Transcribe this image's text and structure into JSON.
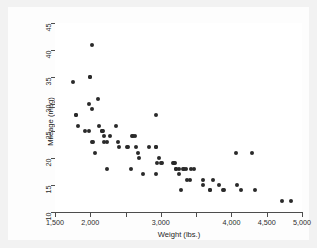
{
  "figure": {
    "background_color": "#f2f2f2",
    "plot_background_color": "#ffffff",
    "marker_color": "#2a2a2a",
    "axis_color": "#4d4d4d"
  },
  "chart_data": {
    "type": "scatter",
    "title": "",
    "xlabel": "Weight (lbs.)",
    "ylabel": "Mileage (mpg)",
    "xlim": [
      1500,
      5000
    ],
    "ylim": [
      10,
      45
    ],
    "grid": false,
    "legend": "none",
    "xticks": [
      1500,
      2000,
      2500,
      3000,
      3500,
      4000,
      4500,
      5000
    ],
    "xticklabels": [
      "1,500",
      "2,000",
      "",
      "3,000",
      "",
      "4,000",
      "4,500",
      "5,000"
    ],
    "yticks": [
      10,
      15,
      20,
      25,
      30,
      35,
      40,
      45
    ],
    "yticklabels": [
      "10",
      "15",
      "20",
      "25",
      "30",
      "35",
      "40",
      "45"
    ],
    "series": [
      {
        "name": "Mileage vs Weight",
        "marker": "circle",
        "color": "#2a2a2a",
        "points": [
          [
            1760,
            34
          ],
          [
            1800,
            28
          ],
          [
            1800,
            28
          ],
          [
            1830,
            26
          ],
          [
            1930,
            25
          ],
          [
            1980,
            25
          ],
          [
            1980,
            30
          ],
          [
            2000,
            35
          ],
          [
            2000,
            35
          ],
          [
            2020,
            41
          ],
          [
            2020,
            29
          ],
          [
            2020,
            23
          ],
          [
            2040,
            23
          ],
          [
            2070,
            21
          ],
          [
            2110,
            31
          ],
          [
            2120,
            26
          ],
          [
            2160,
            25
          ],
          [
            2160,
            25
          ],
          [
            2180,
            25
          ],
          [
            2190,
            24
          ],
          [
            2200,
            23
          ],
          [
            2230,
            23
          ],
          [
            2240,
            18
          ],
          [
            2280,
            24
          ],
          [
            2370,
            26
          ],
          [
            2390,
            23
          ],
          [
            2410,
            22
          ],
          [
            2520,
            22
          ],
          [
            2530,
            22
          ],
          [
            2580,
            18
          ],
          [
            2590,
            24
          ],
          [
            2600,
            24
          ],
          [
            2640,
            24
          ],
          [
            2650,
            22
          ],
          [
            2670,
            21
          ],
          [
            2690,
            20
          ],
          [
            2750,
            17
          ],
          [
            2830,
            22
          ],
          [
            2930,
            28
          ],
          [
            2930,
            22
          ],
          [
            2930,
            22
          ],
          [
            2930,
            17
          ],
          [
            2950,
            19
          ],
          [
            2980,
            20
          ],
          [
            3000,
            19
          ],
          [
            3020,
            19
          ],
          [
            3170,
            19
          ],
          [
            3180,
            19
          ],
          [
            3200,
            19
          ],
          [
            3210,
            18
          ],
          [
            3220,
            18
          ],
          [
            3250,
            18
          ],
          [
            3260,
            17
          ],
          [
            3280,
            14
          ],
          [
            3310,
            18
          ],
          [
            3330,
            18
          ],
          [
            3350,
            18
          ],
          [
            3370,
            16
          ],
          [
            3420,
            16
          ],
          [
            3430,
            18
          ],
          [
            3470,
            18
          ],
          [
            3600,
            16
          ],
          [
            3600,
            15
          ],
          [
            3690,
            14
          ],
          [
            3700,
            14
          ],
          [
            3740,
            16
          ],
          [
            3830,
            15
          ],
          [
            3880,
            14
          ],
          [
            3900,
            14
          ],
          [
            4060,
            21
          ],
          [
            4080,
            15
          ],
          [
            4130,
            14
          ],
          [
            4290,
            21
          ],
          [
            4330,
            14
          ],
          [
            4720,
            12
          ],
          [
            4840,
            12
          ]
        ]
      }
    ]
  },
  "axis_titles": {
    "x": "Weight (lbs.)",
    "y": "Mileage (mpg)"
  }
}
